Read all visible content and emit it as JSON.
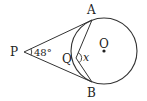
{
  "diagram": {
    "type": "geometry",
    "points": {
      "P": {
        "label": "P",
        "x": 24,
        "y": 52
      },
      "A": {
        "label": "A",
        "x": 92,
        "y": 20
      },
      "B": {
        "label": "B",
        "x": 92,
        "y": 82
      },
      "Q": {
        "label": "Q",
        "x": 76,
        "y": 58
      },
      "O": {
        "label": "O",
        "x": 104,
        "y": 51
      }
    },
    "circle": {
      "center": "O",
      "radius": 33
    },
    "angle_P": {
      "label": "48°"
    },
    "angle_Q": {
      "label": "x"
    },
    "colors": {
      "stroke": "#333333",
      "text": "#222222"
    }
  }
}
